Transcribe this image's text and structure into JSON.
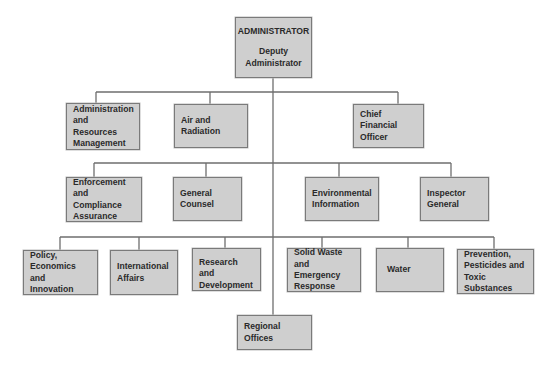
{
  "top": {
    "line1": "ADMINISTRATOR",
    "line2": "Deputy",
    "line3": "Administrator"
  },
  "row1": [
    {
      "lines": [
        "Administration",
        "and Resources",
        "Management"
      ]
    },
    {
      "lines": [
        "Air and",
        "Radiation"
      ]
    },
    {
      "lines": [
        "Chief Financial",
        "Officer"
      ]
    }
  ],
  "row2": [
    {
      "lines": [
        "Enforcement",
        "and Compliance",
        "Assurance"
      ]
    },
    {
      "lines": [
        "General",
        "Counsel"
      ]
    },
    {
      "lines": [
        "Environmental",
        "Information"
      ]
    },
    {
      "lines": [
        "Inspector",
        "General"
      ]
    }
  ],
  "row3": [
    {
      "lines": [
        "Policy, Economics",
        "and Innovation"
      ]
    },
    {
      "lines": [
        "International",
        "Affairs"
      ]
    },
    {
      "lines": [
        "Research and",
        "Development"
      ]
    },
    {
      "lines": [
        "Solid Waste",
        "and Emergency",
        "Response"
      ]
    },
    {
      "lines": [
        "Water"
      ]
    },
    {
      "lines": [
        "Prevention,",
        "Pesticides and",
        "Toxic Substances"
      ]
    }
  ],
  "bottom": {
    "label": "Regional Offices"
  }
}
